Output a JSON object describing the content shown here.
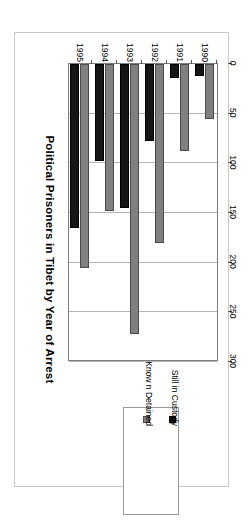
{
  "chart_data": {
    "type": "bar",
    "title": "Political Prisoners in Tibet by Year of Arrest",
    "xlabel": "",
    "ylabel": "",
    "orientation": "rotated-90",
    "grid": true,
    "legend_position": "bottom-right",
    "categories": [
      "1990",
      "1991",
      "1992",
      "1993",
      "1994",
      "1995"
    ],
    "axis_ticks": [
      "0",
      "50",
      "100",
      "150",
      "200",
      "250",
      "300"
    ],
    "ylim": [
      0,
      300
    ],
    "series": [
      {
        "name": "Know n Detained",
        "color": "#808080",
        "values": [
          55,
          88,
          180,
          272,
          148,
          205
        ]
      },
      {
        "name": "Still in Custody",
        "color": "#151515",
        "values": [
          12,
          14,
          78,
          145,
          98,
          165
        ]
      }
    ]
  },
  "legend": {
    "items": [
      {
        "label": "Know n Detained",
        "swatch": "known-swatch"
      },
      {
        "label": "Still in Custody",
        "swatch": "custody-swatch"
      }
    ]
  }
}
